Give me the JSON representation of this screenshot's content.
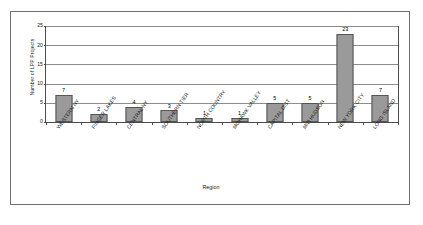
{
  "chart_data": {
    "type": "bar",
    "title": "",
    "xlabel": "Region",
    "ylabel": "Number of LPP Projects",
    "categories": [
      "WESTERN NY",
      "FINGER LAKES",
      "CENTRAL NY",
      "SOUTHERN TIER",
      "NORTH COUNTRY",
      "MOHAWK VALLEY",
      "CAPITAL DIST",
      "MID HUDSON",
      "NEW YORK CITY",
      "LONG ISLAND"
    ],
    "values": [
      7,
      2,
      4,
      3,
      1,
      1,
      5,
      5,
      23,
      7
    ],
    "value_labels": [
      "7",
      "2",
      "4",
      "3",
      "1",
      "1",
      "5",
      "5",
      "23",
      "7"
    ],
    "ylim": [
      0,
      25
    ],
    "yticks": [
      0,
      5,
      10,
      15,
      20,
      25
    ],
    "ytick_labels": [
      "0",
      "5",
      "10",
      "15",
      "20",
      "25"
    ],
    "grid": true,
    "grid_axis": "y",
    "legend": false,
    "bar_color": "#9a9a9a",
    "bar_border_color": "#555555",
    "gridline_color": "#8c8c8c",
    "axis_color": "#4d4d4d",
    "frame_color": "#6e6e6e",
    "background": "#ffffff"
  }
}
